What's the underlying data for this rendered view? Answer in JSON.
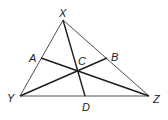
{
  "diagram": {
    "type": "triangle-with-cevians",
    "colors": {
      "background": "#ffffff",
      "stroke": "#2a2a2a",
      "label": "#222222"
    },
    "points": {
      "X": {
        "label": "X",
        "x": 63,
        "y": 20,
        "lx": 59,
        "ly": 17
      },
      "Y": {
        "label": "Y",
        "x": 20,
        "y": 96,
        "lx": 7,
        "ly": 102
      },
      "Z": {
        "label": "Z",
        "x": 149,
        "y": 96,
        "lx": 153,
        "ly": 103
      },
      "A": {
        "label": "A",
        "x": 41,
        "y": 58,
        "lx": 29,
        "ly": 62
      },
      "B": {
        "label": "B",
        "x": 107,
        "y": 58,
        "lx": 111,
        "ly": 61
      },
      "C": {
        "label": "C",
        "x": 77,
        "y": 71,
        "lx": 78,
        "ly": 65
      },
      "D": {
        "label": "D",
        "x": 85,
        "y": 96,
        "lx": 82,
        "ly": 111
      }
    },
    "triangle": [
      "X",
      "Y",
      "Z"
    ],
    "segments": [
      {
        "from": "X",
        "to": "D"
      },
      {
        "from": "A",
        "to": "Z"
      },
      {
        "from": "Y",
        "to": "B"
      }
    ],
    "labels": [
      "X",
      "Y",
      "Z",
      "A",
      "B",
      "C",
      "D"
    ]
  }
}
